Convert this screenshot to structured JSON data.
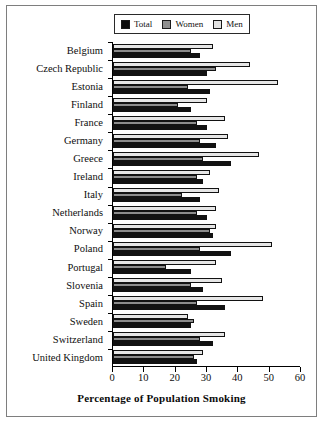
{
  "chart_data": {
    "type": "bar",
    "orientation": "horizontal",
    "title": "",
    "xlabel": "Percentage of Population Smoking",
    "ylabel": "",
    "xlim": [
      0,
      60
    ],
    "xticks": [
      0,
      10,
      20,
      30,
      40,
      50,
      60
    ],
    "grid": false,
    "legend_position": "top",
    "categories": [
      "Belgium",
      "Czech Republic",
      "Estonia",
      "Finland",
      "France",
      "Germany",
      "Greece",
      "Ireland",
      "Italy",
      "Netherlands",
      "Norway",
      "Poland",
      "Portugal",
      "Slovenia",
      "Spain",
      "Sweden",
      "Switzerland",
      "United Kingdom"
    ],
    "series": [
      {
        "name": "Men",
        "color": "#e6e6e6",
        "values": [
          32,
          44,
          53,
          30,
          36,
          37,
          47,
          31,
          34,
          33,
          33,
          51,
          33,
          35,
          48,
          24,
          36,
          29
        ]
      },
      {
        "name": "Women",
        "color": "#8c8c8c",
        "values": [
          25,
          33,
          24,
          21,
          27,
          28,
          29,
          27,
          22,
          27,
          31,
          28,
          17,
          25,
          27,
          26,
          28,
          26
        ]
      },
      {
        "name": "Total",
        "color": "#121212",
        "values": [
          28,
          30,
          31,
          25,
          30,
          33,
          38,
          29,
          28,
          30,
          32,
          38,
          25,
          29,
          36,
          25,
          32,
          27
        ]
      }
    ]
  },
  "legend": {
    "entries": [
      {
        "label": "Total",
        "swatch": "sw-total"
      },
      {
        "label": "Women",
        "swatch": "sw-women"
      },
      {
        "label": "Men",
        "swatch": "sw-men"
      }
    ]
  },
  "colors": {
    "total": "#121212",
    "women": "#8c8c8c",
    "men": "#e6e6e6",
    "axis": "#000000",
    "frame": "#7e7e7e"
  }
}
